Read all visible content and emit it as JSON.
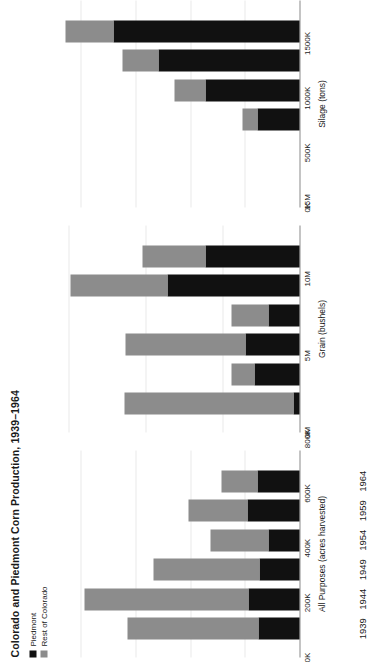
{
  "title": "Colorado and Piedmont Corn Production, 1939–1964",
  "legend": {
    "position": "top-left",
    "items": [
      {
        "label": "Piedmont",
        "color": "#111111"
      },
      {
        "label": "Rest of Colorado",
        "color": "#8c8c8c"
      }
    ]
  },
  "colors": {
    "piedmont": "#111111",
    "rest_of_colorado": "#8c8c8c",
    "grid": "#e9e9e9",
    "axis": "#8a8a8a"
  },
  "chart_data": {
    "type": "bar",
    "orientation": "vertical-stacked",
    "title": "Colorado and Piedmont Corn Production, 1939–1964",
    "xlabel": "",
    "grid": true,
    "legend": [
      "Piedmont",
      "Rest of Colorado"
    ],
    "categories": [
      "1939",
      "1944",
      "1949",
      "1954",
      "1959",
      "1964"
    ],
    "panels": [
      {
        "name": "all-purposes",
        "axis_title": "All Purposes (acres harvested)",
        "ylim": [
          0,
          900000
        ],
        "ticks": [
          0,
          200000,
          400000,
          600000,
          800000
        ],
        "ticklabels": [
          "0K",
          "200K",
          "400K",
          "600K",
          "800K"
        ],
        "series": [
          {
            "name": "Piedmont",
            "values": [
              150000,
              185000,
              145000,
              115000,
              190000,
              155000
            ]
          },
          {
            "name": "Rest of Colorado",
            "values": [
              480000,
              600000,
              390000,
              210000,
              215000,
              130000
            ]
          }
        ],
        "totals": [
          630000,
          785000,
          535000,
          325000,
          405000,
          285000
        ]
      },
      {
        "name": "grain",
        "axis_title": "Grain (bushels)",
        "ylim": [
          0,
          16000000
        ],
        "ticks": [
          0,
          5000000,
          10000000,
          15000000
        ],
        "ticklabels": [
          "0M",
          "5M",
          "10M",
          "15M"
        ],
        "series": [
          {
            "name": "Piedmont",
            "values": [
              400000,
              2900000,
              3500000,
              2000000,
              8600000,
              6100000
            ]
          },
          {
            "name": "Rest of Colorado",
            "values": [
              11000000,
              1500000,
              7800000,
              2400000,
              6300000,
              4100000
            ]
          }
        ],
        "totals": [
          11400000,
          4400000,
          11300000,
          4400000,
          14900000,
          10200000
        ]
      },
      {
        "name": "silage",
        "axis_title": "Silage (tons)",
        "ylim": [
          0,
          2250000
        ],
        "ticks": [
          0,
          500000,
          1000000,
          1500000,
          2000000
        ],
        "ticklabels": [
          "0K",
          "500K",
          "1000K",
          "1500K",
          "2000K"
        ],
        "series": [
          {
            "name": "Piedmont",
            "values": [
              0,
              0,
              380000,
              860000,
              1290000,
              1700000
            ]
          },
          {
            "name": "Rest of Colorado",
            "values": [
              0,
              0,
              140000,
              280000,
              330000,
              440000
            ]
          }
        ],
        "totals": [
          0,
          0,
          520000,
          1140000,
          1620000,
          2140000
        ]
      }
    ]
  }
}
